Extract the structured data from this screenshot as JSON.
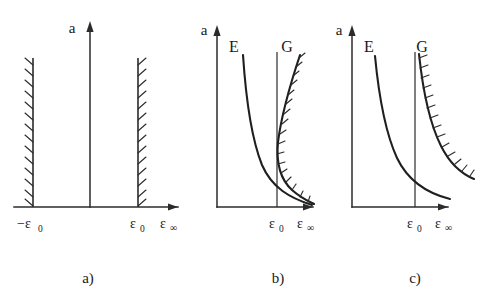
{
  "figure": {
    "background_color": "#ffffff",
    "ink_color": "#1f1f1f",
    "panels": [
      {
        "id": "a",
        "caption": "a)",
        "y_axis_label": "a",
        "x_axis_label_symbol": "ε",
        "x_axis_label_subscript": "∞",
        "tick_labels": [
          {
            "name": "minus-epsilon-zero",
            "symbol": "−ε",
            "subscript": "0"
          },
          {
            "name": "epsilon-zero",
            "symbol": "ε",
            "subscript": "0"
          }
        ],
        "curve_labels": [],
        "description": "Two vertical hatched boundary lines at -e0 and +e0 with a plain vertical axis between them."
      },
      {
        "id": "b",
        "caption": "b)",
        "y_axis_label": "a",
        "x_axis_label_symbol": "ε",
        "x_axis_label_subscript": "∞",
        "tick_labels": [
          {
            "name": "epsilon-zero",
            "symbol": "ε",
            "subscript": "0"
          }
        ],
        "curve_labels": [
          {
            "name": "curve-label-e",
            "text": "E"
          },
          {
            "name": "curve-label-g",
            "text": "G"
          }
        ],
        "description": "Curve E is a smooth hyperbola decaying from upper-left to lower-right. Curve G is a backward-C shape that descends from the top, bends left across the e0 line and sweeps back to the right along the bottom; it carries hatching on its outer side."
      },
      {
        "id": "c",
        "caption": "c)",
        "y_axis_label": "a",
        "x_axis_label_symbol": "ε",
        "x_axis_label_subscript": "∞",
        "tick_labels": [
          {
            "name": "epsilon-zero",
            "symbol": "ε",
            "subscript": "0"
          }
        ],
        "curve_labels": [
          {
            "name": "curve-label-e",
            "text": "E"
          },
          {
            "name": "curve-label-g",
            "text": "G"
          }
        ],
        "description": "Two monotonically decaying hyperbolas that cross near the e0 line; curve E on the left is plain and curve G on the right carries hatching on its right side."
      }
    ]
  }
}
